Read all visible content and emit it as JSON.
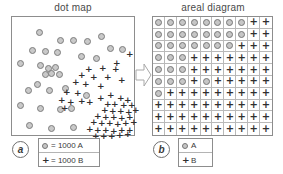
{
  "figure": {
    "panel_a": {
      "tag": "a",
      "title": "dot map",
      "legend": [
        {
          "symbol": "circle-icon",
          "text": "= 1000 A"
        },
        {
          "symbol": "plus-icon",
          "text": "= 1000 B"
        }
      ],
      "dots_A": [
        [
          24,
          12
        ],
        [
          86,
          16
        ],
        [
          45,
          20
        ],
        [
          58,
          20
        ],
        [
          72,
          21
        ],
        [
          17,
          30
        ],
        [
          30,
          31
        ],
        [
          42,
          32
        ],
        [
          95,
          28
        ],
        [
          107,
          29
        ],
        [
          66,
          36
        ],
        [
          81,
          38
        ],
        [
          5,
          43
        ],
        [
          25,
          45
        ],
        [
          33,
          48
        ],
        [
          40,
          47
        ],
        [
          36,
          53
        ],
        [
          44,
          54
        ],
        [
          30,
          54
        ],
        [
          13,
          70
        ],
        [
          34,
          70
        ],
        [
          50,
          68
        ],
        [
          5,
          85
        ],
        [
          25,
          88
        ],
        [
          45,
          89
        ],
        [
          71,
          75
        ],
        [
          14,
          105
        ],
        [
          36,
          108
        ],
        [
          58,
          107
        ],
        [
          22,
          64
        ],
        [
          56,
          88
        ]
      ],
      "plus_B": [
        [
          114,
          34
        ],
        [
          101,
          43
        ],
        [
          73,
          49
        ],
        [
          87,
          48
        ],
        [
          100,
          49
        ],
        [
          66,
          55
        ],
        [
          78,
          57
        ],
        [
          92,
          57
        ],
        [
          106,
          60
        ],
        [
          60,
          62
        ],
        [
          70,
          64
        ],
        [
          85,
          66
        ],
        [
          51,
          72
        ],
        [
          62,
          73
        ],
        [
          46,
          80
        ],
        [
          55,
          82
        ],
        [
          66,
          81
        ],
        [
          74,
          82
        ],
        [
          49,
          88
        ],
        [
          95,
          75
        ],
        [
          105,
          78
        ],
        [
          112,
          80
        ],
        [
          99,
          84
        ],
        [
          108,
          85
        ],
        [
          116,
          85
        ],
        [
          89,
          90
        ],
        [
          97,
          91
        ],
        [
          105,
          91
        ],
        [
          113,
          92
        ],
        [
          120,
          90
        ],
        [
          82,
          96
        ],
        [
          90,
          97
        ],
        [
          98,
          97
        ],
        [
          106,
          98
        ],
        [
          114,
          97
        ],
        [
          78,
          102
        ],
        [
          86,
          103
        ],
        [
          94,
          103
        ],
        [
          102,
          104
        ],
        [
          110,
          103
        ],
        [
          118,
          102
        ],
        [
          74,
          109
        ],
        [
          82,
          110
        ],
        [
          90,
          110
        ],
        [
          98,
          111
        ],
        [
          106,
          110
        ],
        [
          114,
          110
        ],
        [
          80,
          116
        ],
        [
          88,
          116
        ],
        [
          96,
          116
        ],
        [
          104,
          115
        ],
        [
          112,
          114
        ],
        [
          92,
          84
        ],
        [
          85,
          78
        ]
      ]
    },
    "panel_b": {
      "tag": "b",
      "title": "areal diagram",
      "legend": [
        {
          "symbol": "circle-icon",
          "text": "A"
        },
        {
          "symbol": "plus-icon",
          "text": "B"
        }
      ],
      "grid_rows": 10,
      "grid_cols": 10,
      "grid": [
        [
          "A",
          "A",
          "A",
          "A",
          "A",
          "A",
          "A",
          "A",
          "B",
          "B"
        ],
        [
          "A",
          "A",
          "A",
          "A",
          "A",
          "A",
          "A",
          "A",
          "B",
          "B"
        ],
        [
          "A",
          "A",
          "A",
          "A",
          "A",
          "A",
          "A",
          "B",
          "B",
          "B"
        ],
        [
          "A",
          "A",
          "A",
          "B",
          "B",
          "B",
          "B",
          "B",
          "B",
          "B"
        ],
        [
          "A",
          "A",
          "A",
          "B",
          "B",
          "B",
          "B",
          "B",
          "B",
          "B"
        ],
        [
          "A",
          "A",
          "A",
          "B",
          "A",
          "B",
          "B",
          "B",
          "B",
          "B"
        ],
        [
          "A",
          "B",
          "B",
          "B",
          "B",
          "B",
          "B",
          "B",
          "B",
          "B"
        ],
        [
          "B",
          "B",
          "B",
          "B",
          "B",
          "B",
          "B",
          "B",
          "B",
          "B"
        ],
        [
          "B",
          "B",
          "B",
          "B",
          "B",
          "B",
          "B",
          "B",
          "B",
          "B"
        ],
        [
          "B",
          "B",
          "B",
          "B",
          "B",
          "B",
          "B",
          "B",
          "B",
          "B"
        ]
      ]
    },
    "arrow": {
      "name": "right-arrow-icon",
      "direction": "right"
    },
    "colors": {
      "symbol_fill": "#c6c6c6",
      "symbol_stroke": "#777777",
      "plus_color": "#2f2f2f",
      "box_border": "#8d8d8d",
      "grid_line": "#b9b9b9",
      "text": "#3a3a3a",
      "background": "#ffffff"
    }
  }
}
